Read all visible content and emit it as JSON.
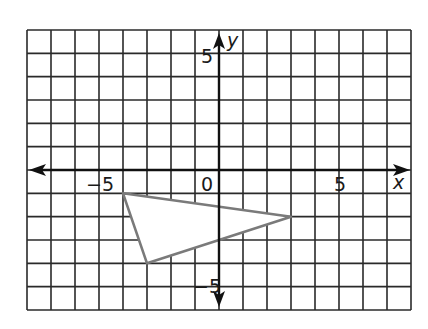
{
  "chart_data": {
    "type": "coordinate-grid",
    "title": "",
    "xlabel": "x",
    "ylabel": "y",
    "xlim": [
      -8,
      8
    ],
    "ylim": [
      -6,
      6
    ],
    "grid": true,
    "tick_labels": {
      "x": [
        {
          "value": -5,
          "label": "−5"
        },
        {
          "value": 0,
          "label": "0"
        },
        {
          "value": 5,
          "label": "5"
        }
      ],
      "y": [
        {
          "value": 5,
          "label": "5"
        },
        {
          "value": -5,
          "label": "−5"
        }
      ]
    },
    "shapes": [
      {
        "type": "triangle",
        "vertices": [
          [
            -4,
            -1
          ],
          [
            3,
            -2
          ],
          [
            -3,
            -4
          ]
        ],
        "stroke": "#7a7a7a",
        "fill": "#ffffff"
      }
    ]
  },
  "labels": {
    "x_axis": "x",
    "y_axis": "y",
    "x_neg5": "−5",
    "x_zero": "0",
    "x_pos5": "5",
    "y_pos5": "5",
    "y_neg5": "−5"
  },
  "colors": {
    "grid": "#2a2a2a",
    "axis": "#111111",
    "triangle": "#7a7a7a"
  }
}
